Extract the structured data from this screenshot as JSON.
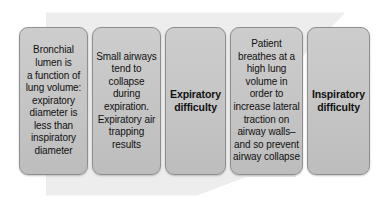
{
  "diagram": {
    "type": "process-flow",
    "background_arrow": {
      "name": "right-pointing-arrow",
      "color": "#ececec",
      "direction": "right"
    },
    "box_fill_color": "#c6c6c6",
    "box_border_color": "#8e8e8e",
    "text_color": "#111111",
    "frame_color": "#ffffff",
    "steps": [
      {
        "id": "step-1",
        "label": "Bronchial\nlumen is\na function of\nlung volume:\nexpiratory\ndiameter is\nless than\ninspiratory\ndiameter",
        "emphasis": "normal"
      },
      {
        "id": "step-2",
        "label": "Small airways\ntend to\ncollapse\nduring\nexpiration.\nExpiratory air\ntrapping\nresults",
        "emphasis": "normal"
      },
      {
        "id": "step-3",
        "label": "Expiratory\ndifficulty",
        "emphasis": "bold"
      },
      {
        "id": "step-4",
        "label": "Patient\nbreathes at a\nhigh lung\nvolume in\norder to\nincrease lateral\ntraction on\nairway walls–\nand so prevent\nairway collapse",
        "emphasis": "normal"
      },
      {
        "id": "step-5",
        "label": "Inspiratory\ndifficulty",
        "emphasis": "bold"
      }
    ]
  }
}
